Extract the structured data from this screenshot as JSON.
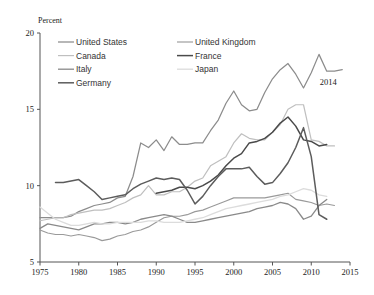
{
  "chart_data": {
    "type": "line",
    "title": "",
    "ylabel": "Percent",
    "xlabel": "",
    "xlim": [
      1975,
      2015
    ],
    "ylim": [
      5,
      20
    ],
    "xticks": [
      "1975",
      "1980",
      "1985",
      "1990",
      "1995",
      "2000",
      "2005",
      "2010",
      "2015"
    ],
    "yticks": [
      "5",
      "10",
      "15",
      "20"
    ],
    "grid": false,
    "legend_position": "top-left",
    "annotations": [
      {
        "text": "2014",
        "x": 2012.2,
        "y": 16.6
      }
    ],
    "series": [
      {
        "name": "United States",
        "color": "#8c8c8c",
        "width": 1.25,
        "x": [
          1975,
          1976,
          1977,
          1978,
          1979,
          1980,
          1981,
          1982,
          1983,
          1984,
          1985,
          1986,
          1987,
          1988,
          1989,
          1990,
          1991,
          1992,
          1993,
          1994,
          1995,
          1996,
          1997,
          1998,
          1999,
          2000,
          2001,
          2002,
          2003,
          2004,
          2005,
          2006,
          2007,
          2008,
          2009,
          2010,
          2011,
          2012,
          2013,
          2014
        ],
        "values": [
          7.9,
          7.9,
          7.9,
          7.9,
          8.0,
          8.3,
          8.5,
          8.7,
          8.8,
          8.9,
          9.2,
          9.3,
          10.6,
          12.8,
          12.5,
          13.0,
          12.3,
          13.2,
          12.7,
          12.7,
          12.8,
          12.8,
          13.6,
          14.3,
          15.4,
          16.2,
          15.3,
          14.9,
          15.0,
          16.1,
          17.0,
          17.6,
          18.0,
          17.3,
          16.4,
          17.4,
          18.6,
          17.5,
          17.5,
          17.6
        ]
      },
      {
        "name": "United Kingdom",
        "color": "#9a9a9a",
        "width": 1.15,
        "x": [
          1975,
          1976,
          1977,
          1978,
          1979,
          1980,
          1981,
          1982,
          1983,
          1984,
          1985,
          1986,
          1987,
          1988,
          1989,
          1990,
          1991,
          1992,
          1993,
          1994,
          1995,
          1996,
          1997,
          1998,
          1999,
          2000,
          2001,
          2002,
          2003,
          2004,
          2005,
          2006,
          2007,
          2008,
          2009,
          2010,
          2011,
          2012,
          2013
        ],
        "values": [
          7.1,
          6.9,
          6.8,
          6.8,
          6.7,
          6.8,
          6.7,
          6.6,
          6.4,
          6.5,
          6.7,
          6.8,
          7.0,
          7.1,
          7.3,
          7.6,
          7.9,
          8.0,
          8.0,
          8.1,
          8.3,
          8.4,
          8.6,
          8.8,
          9.0,
          9.2,
          9.2,
          9.2,
          9.2,
          9.2,
          9.3,
          9.4,
          9.5,
          9.1,
          9.0,
          8.9,
          8.7,
          8.8,
          8.7
        ]
      },
      {
        "name": "Canada",
        "color": "#bfbfbf",
        "width": 1.2,
        "x": [
          1975,
          1976,
          1977,
          1978,
          1979,
          1980,
          1981,
          1982,
          1983,
          1984,
          1985,
          1986,
          1987,
          1988,
          1989,
          1990,
          1991,
          1992,
          1993,
          1994,
          1995,
          1996,
          1997,
          1998,
          1999,
          2000,
          2001,
          2002,
          2003,
          2004,
          2005,
          2006,
          2007,
          2008,
          2009,
          2010,
          2011,
          2012,
          2013
        ],
        "values": [
          7.7,
          7.8,
          7.9,
          7.9,
          8.1,
          8.2,
          8.3,
          8.4,
          8.4,
          8.5,
          8.7,
          8.9,
          9.2,
          9.4,
          10.0,
          9.4,
          9.4,
          9.6,
          9.6,
          9.9,
          10.3,
          10.5,
          11.3,
          11.6,
          11.9,
          12.8,
          13.4,
          13.1,
          13.0,
          13.0,
          13.5,
          14.0,
          15.0,
          15.3,
          15.3,
          13.0,
          12.9,
          12.6,
          12.6
        ]
      },
      {
        "name": "France",
        "color": "#4a4a4a",
        "width": 1.5,
        "x": [
          1990,
          1991,
          1992,
          1993,
          1994,
          1995,
          1996,
          1997,
          1998,
          1999,
          2000,
          2001,
          2002,
          2003,
          2004,
          2005,
          2006,
          2007,
          2008,
          2009,
          2010,
          2011,
          2012
        ],
        "values": [
          9.5,
          9.6,
          9.7,
          9.9,
          9.9,
          9.8,
          10.0,
          10.3,
          10.7,
          11.3,
          11.8,
          12.1,
          12.8,
          12.9,
          13.1,
          13.5,
          14.1,
          14.5,
          13.9,
          13.0,
          12.9,
          12.6,
          12.7
        ]
      },
      {
        "name": "Italy",
        "color": "#8a8a8a",
        "width": 1.3,
        "x": [
          1975,
          1976,
          1977,
          1978,
          1979,
          1980,
          1981,
          1982,
          1983,
          1984,
          1985,
          1986,
          1987,
          1988,
          1989,
          1990,
          1991,
          1992,
          1993,
          1994,
          1995,
          1996,
          1997,
          1998,
          1999,
          2000,
          2001,
          2002,
          2003,
          2004,
          2005,
          2006,
          2007,
          2008,
          2009,
          2010,
          2011,
          2012
        ],
        "values": [
          7.2,
          7.5,
          7.4,
          7.3,
          7.2,
          7.1,
          7.3,
          7.5,
          7.5,
          7.6,
          7.6,
          7.5,
          7.6,
          7.8,
          7.9,
          8.0,
          8.1,
          8.0,
          7.8,
          7.6,
          7.6,
          7.7,
          7.8,
          7.9,
          8.0,
          8.1,
          8.2,
          8.3,
          8.5,
          8.6,
          8.7,
          8.9,
          8.8,
          8.5,
          7.8,
          8.0,
          8.7,
          9.1
        ]
      },
      {
        "name": "Japan",
        "color": "#dcdcdc",
        "width": 1.3,
        "x": [
          1975,
          1976,
          1977,
          1978,
          1979,
          1980,
          1981,
          1982,
          1983,
          1984,
          1985,
          1986,
          1987,
          1988,
          1989,
          1990,
          1991,
          1992,
          1993,
          1994,
          1995,
          1996,
          1997,
          1998,
          1999,
          2000,
          2001,
          2002,
          2003,
          2004,
          2005,
          2006,
          2007,
          2008,
          2009,
          2010,
          2011,
          2012
        ],
        "values": [
          8.6,
          8.2,
          7.8,
          7.6,
          7.4,
          7.4,
          7.5,
          7.6,
          7.5,
          7.5,
          7.6,
          7.6,
          7.6,
          7.6,
          7.7,
          7.7,
          7.6,
          7.6,
          7.6,
          7.7,
          7.8,
          7.9,
          8.1,
          8.3,
          8.5,
          8.6,
          8.7,
          8.8,
          8.9,
          9.0,
          9.1,
          9.3,
          9.4,
          9.6,
          9.8,
          9.7,
          9.4,
          9.3
        ]
      },
      {
        "name": "Germany",
        "color": "#5c5c5c",
        "width": 1.5,
        "x": [
          1977,
          1978,
          1979,
          1980,
          1981,
          1982,
          1983,
          1984,
          1985,
          1986,
          1987,
          1988,
          1989,
          1990,
          1991,
          1992,
          1993,
          1994,
          1995,
          1996,
          1997,
          1998,
          1999,
          2000,
          2001,
          2002,
          2003,
          2004,
          2005,
          2006,
          2007,
          2008,
          2009,
          2010,
          2011,
          2012
        ],
        "values": [
          10.2,
          10.2,
          10.3,
          10.4,
          10.0,
          9.6,
          9.1,
          9.2,
          9.3,
          9.4,
          9.8,
          10.1,
          10.3,
          10.5,
          10.4,
          10.5,
          10.4,
          9.7,
          8.8,
          9.3,
          10.0,
          10.6,
          11.1,
          11.1,
          11.1,
          11.2,
          10.6,
          10.1,
          10.2,
          10.8,
          11.5,
          12.5,
          13.8,
          11.9,
          8.1,
          7.8
        ]
      }
    ],
    "legend_columns": [
      [
        {
          "label": "United States",
          "color": "#8c8c8c",
          "width": 1.25
        },
        {
          "label": "Canada",
          "color": "#bfbfbf",
          "width": 1.2
        },
        {
          "label": "Italy",
          "color": "#8a8a8a",
          "width": 1.3
        },
        {
          "label": "Germany",
          "color": "#5c5c5c",
          "width": 1.5
        }
      ],
      [
        {
          "label": "United Kingdom",
          "color": "#9a9a9a",
          "width": 1.15
        },
        {
          "label": "France",
          "color": "#4a4a4a",
          "width": 1.5
        },
        {
          "label": "Japan",
          "color": "#dcdcdc",
          "width": 1.3
        }
      ]
    ]
  }
}
